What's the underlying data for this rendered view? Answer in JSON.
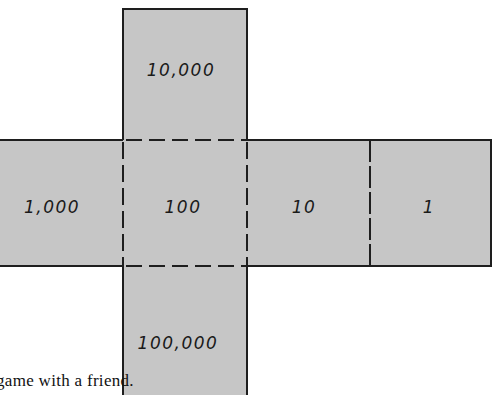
{
  "figure": {
    "type": "cube-net",
    "fill_color": "#c6c6c6",
    "line_color": "#1e1e1e",
    "faces": [
      {
        "id": "top",
        "label": "10,000"
      },
      {
        "id": "left",
        "label": "1,000"
      },
      {
        "id": "center",
        "label": "100"
      },
      {
        "id": "right",
        "label": "10"
      },
      {
        "id": "far-right",
        "label": "1"
      },
      {
        "id": "bottom",
        "label": "100,000"
      }
    ]
  },
  "caption": {
    "text": "game with a friend."
  }
}
